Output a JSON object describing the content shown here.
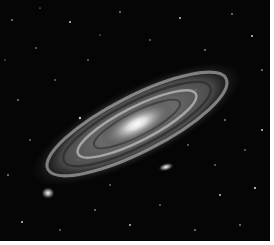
{
  "image": {
    "subject": "spiral galaxy with two satellite galaxies in a star field",
    "colors": {
      "background": "#050505",
      "border": "#ffffff",
      "core": "#ffffff",
      "disk": "#bdbdbd",
      "dust": "#2a2a2a"
    },
    "galaxy": {
      "cx": 137,
      "cy": 124,
      "rx": 110,
      "ry": 32,
      "angle": -27
    },
    "satellites": [
      {
        "name": "satellite-near-center",
        "cx": 166,
        "cy": 167,
        "rx": 8,
        "ry": 4
      },
      {
        "name": "satellite-lower-left",
        "cx": 48,
        "cy": 193,
        "rx": 6,
        "ry": 5
      }
    ]
  }
}
